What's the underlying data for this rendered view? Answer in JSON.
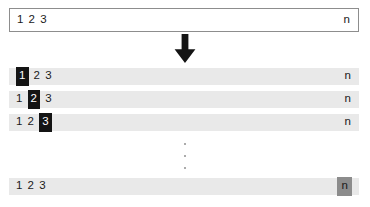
{
  "diagram": {
    "source_row": {
      "left_items": [
        "1",
        "2",
        "3"
      ],
      "right_item": "n",
      "highlight": null
    },
    "arrow": {
      "icon": "arrow-down-icon",
      "direction": "down",
      "color": "#141414"
    },
    "iterations": [
      {
        "left_items": [
          "1",
          "2",
          "3"
        ],
        "right_item": "n",
        "highlight_index": 0,
        "highlight_style": "dark"
      },
      {
        "left_items": [
          "1",
          "2",
          "3"
        ],
        "right_item": "n",
        "highlight_index": 1,
        "highlight_style": "dark"
      },
      {
        "left_items": [
          "1",
          "2",
          "3"
        ],
        "right_item": "n",
        "highlight_index": 2,
        "highlight_style": "dark"
      }
    ],
    "ellipsis": {
      "icon": "vertical-ellipsis-icon",
      "dots": 3
    },
    "final_iteration": {
      "left_items": [
        "1",
        "2",
        "3"
      ],
      "right_item": "n",
      "highlight_target": "right",
      "highlight_style": "gray"
    },
    "colors": {
      "row_background": "#e9e9e9",
      "source_background": "#ffffff",
      "source_border": "#8d8d8d",
      "highlight_dark": "#141414",
      "highlight_gray": "#8c8c8c",
      "text": "#1a1a1a",
      "highlight_dark_text": "#ffffff",
      "dot": "#9a9a9a"
    }
  }
}
